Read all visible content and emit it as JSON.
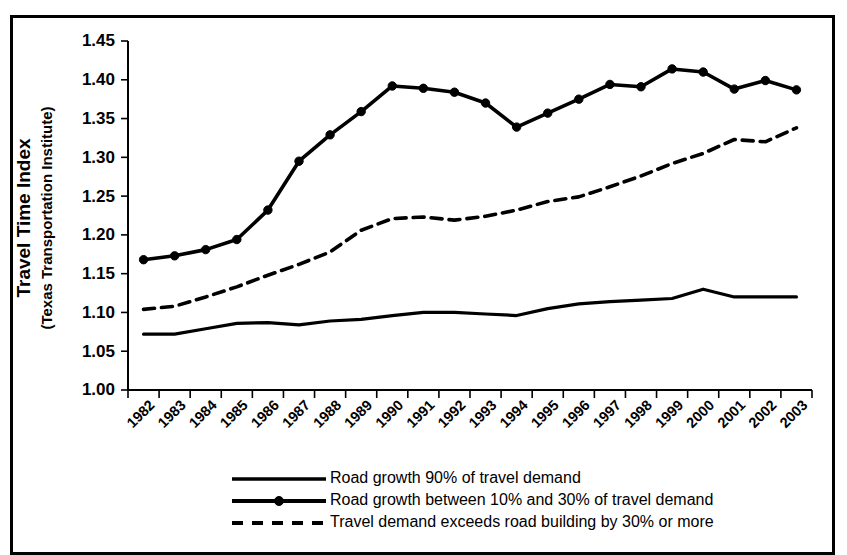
{
  "figure": {
    "border_color": "#000000",
    "background_color": "#ffffff"
  },
  "chart_data": {
    "type": "line",
    "title": "",
    "xlabel": "",
    "ylabel": "Travel Time Index",
    "ylabel_sub": "(Texas Transportation Institute)",
    "ylim": [
      1.0,
      1.45
    ],
    "ytick_values": [
      1.0,
      1.05,
      1.1,
      1.15,
      1.2,
      1.25,
      1.3,
      1.35,
      1.4,
      1.45
    ],
    "ytick_labels": [
      "1.00",
      "1.05",
      "1.10",
      "1.15",
      "1.20",
      "1.25",
      "1.30",
      "1.35",
      "1.40",
      "1.45"
    ],
    "grid": false,
    "legend_position": "bottom",
    "categories": [
      1982,
      1983,
      1984,
      1985,
      1986,
      1987,
      1988,
      1989,
      1990,
      1991,
      1992,
      1993,
      1994,
      1995,
      1996,
      1997,
      1998,
      1999,
      2000,
      2001,
      2002,
      2003
    ],
    "xtick_labels": [
      "1982",
      "1983",
      "1984",
      "1985",
      "1986",
      "1987",
      "1988",
      "1989",
      "1990",
      "1991",
      "1992",
      "1993",
      "1994",
      "1995",
      "1996",
      "1997",
      "1998",
      "1999",
      "2000",
      "2001",
      "2002",
      "2003"
    ],
    "series": [
      {
        "name": "Road growth 90% of travel demand",
        "style": "solid",
        "markers": false,
        "values": [
          1.072,
          1.072,
          1.079,
          1.086,
          1.087,
          1.084,
          1.089,
          1.091,
          1.096,
          1.1,
          1.1,
          1.098,
          1.096,
          1.105,
          1.111,
          1.114,
          1.116,
          1.118,
          1.13,
          1.12,
          1.12,
          1.12
        ]
      },
      {
        "name": "Road growth between 10% and 30% of travel demand",
        "style": "solid-markers",
        "markers": true,
        "values": [
          1.168,
          1.173,
          1.181,
          1.194,
          1.232,
          1.295,
          1.329,
          1.359,
          1.392,
          1.389,
          1.384,
          1.37,
          1.339,
          1.357,
          1.375,
          1.394,
          1.391,
          1.414,
          1.41,
          1.388,
          1.399,
          1.387
        ]
      },
      {
        "name": "Travel demand exceeds road building by 30% or more",
        "style": "dashed",
        "markers": false,
        "values": [
          1.104,
          1.108,
          1.12,
          1.133,
          1.148,
          1.162,
          1.178,
          1.206,
          1.221,
          1.223,
          1.219,
          1.224,
          1.232,
          1.243,
          1.249,
          1.262,
          1.276,
          1.292,
          1.305,
          1.323,
          1.32,
          1.338
        ]
      }
    ],
    "legend": [
      {
        "label": "Road growth 90% of travel demand",
        "style": "solid"
      },
      {
        "label": "Road growth between 10% and 30% of travel demand",
        "style": "solid-markers"
      },
      {
        "label": "Travel demand exceeds road building by 30% or more",
        "style": "dashed"
      }
    ]
  }
}
